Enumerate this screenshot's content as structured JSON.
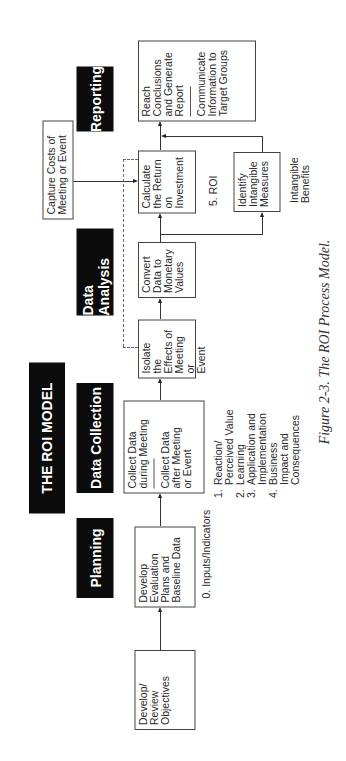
{
  "title": "THE ROI MODEL",
  "phases": {
    "planning": "Planning",
    "data_collection": "Data Collection",
    "data_analysis": "Data Analysis",
    "reporting": "Reporting"
  },
  "boxes": {
    "develop_review": "Develop/\nReview\nObjectives",
    "develop_evaluation": "Develop\nEvaluation\nPlans and\nBaseline Data",
    "collect_during": "Collect Data\nduring Meeting",
    "collect_after": "Collect Data\nafter Meeting\nor Event",
    "isolate": "Isolate\nthe\nEffects of\nMeeting or\nEvent",
    "convert": "Convert\nData to\nMonetary\nValues",
    "calculate": "Calculate\nthe Return\non\nInvestment",
    "identify": "Identify\nIntangible\nMeasures",
    "capture": "Capture Costs of\nMeeting or Event",
    "reach": "Reach\nConclusions\nand Generate\nReport",
    "communicate": "Communicate\nInformation to\nTarget Groups"
  },
  "annotations": {
    "inputs": "0. Inputs/Indicators",
    "roi": "5. ROI",
    "intangible_benefits": "Intangible\nBenefits"
  },
  "levels": [
    {
      "num": "1.",
      "text": "Reaction/\nPerceived Value"
    },
    {
      "num": "2.",
      "text": "Learning"
    },
    {
      "num": "3.",
      "text": "Application and\nImplementation"
    },
    {
      "num": "4.",
      "text": "Business\nImpact and\nConsequences"
    }
  ],
  "caption": "Figure 2-3.  The ROI Process Model."
}
